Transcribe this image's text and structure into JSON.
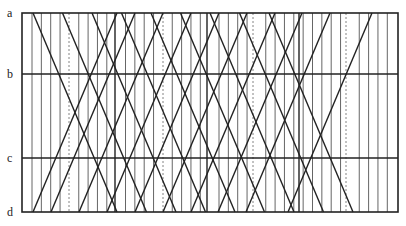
{
  "diagram": {
    "type": "space-time line diagram",
    "row_labels": [
      {
        "id": "a",
        "label": "a",
        "y": 13
      },
      {
        "id": "b",
        "label": "b",
        "y": 74
      },
      {
        "id": "c",
        "label": "c",
        "y": 158
      },
      {
        "id": "d",
        "label": "d",
        "y": 212
      }
    ],
    "frame": {
      "left": 22,
      "right": 398,
      "top": 13,
      "bottom": 212
    },
    "vertical_lines": {
      "start": 32,
      "spacing": 9.35,
      "count": 39
    },
    "dashed_lines_x": [
      69,
      163,
      253,
      346
    ],
    "heavy_vertical_lines_x": [
      115,
      207,
      299
    ],
    "descending_lines": {
      "top_x": [
        33,
        62.5,
        92,
        121.5,
        151,
        180.5,
        210,
        239.5,
        269
      ],
      "dx": 84
    },
    "ascending_lines": {
      "bottom_x": [
        33,
        51,
        79,
        107,
        135,
        163,
        191,
        218,
        246,
        288
      ],
      "dx": 84
    },
    "colors": {
      "line": "#222222",
      "grid": "#555555",
      "dashed": "#777777"
    }
  }
}
